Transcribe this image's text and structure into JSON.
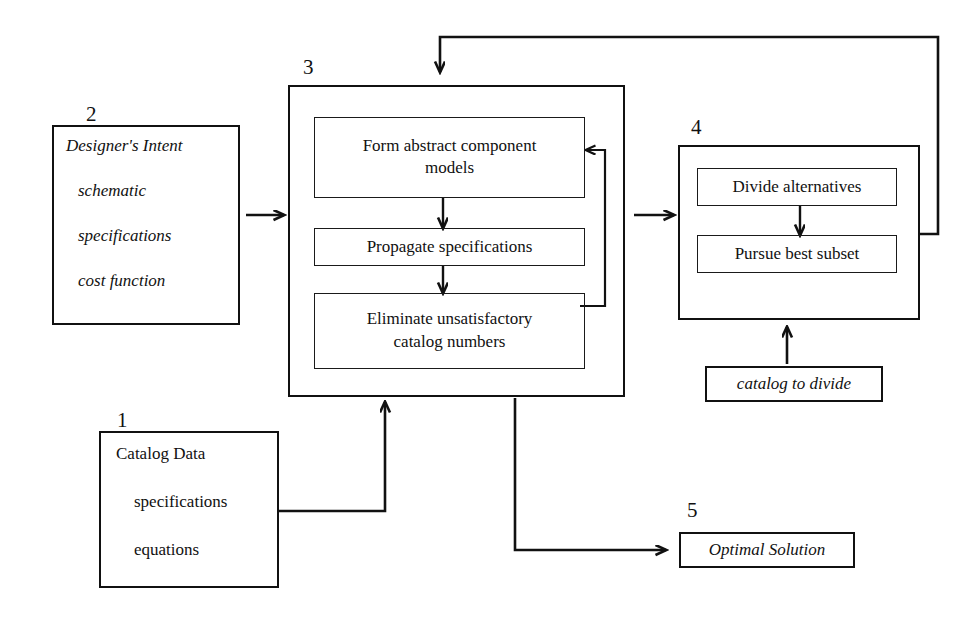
{
  "diagram": {
    "background_color": "#ffffff",
    "line_color": "#111111"
  },
  "numbers": {
    "one": "1",
    "two": "2",
    "three": "3",
    "four": "4",
    "five": "5"
  },
  "block1": {
    "number": "1",
    "lines": [
      "Catalog Data",
      "specifications",
      "equations"
    ]
  },
  "block2": {
    "number": "2",
    "lines": [
      "Designer's Intent",
      "schematic",
      "specifications",
      "cost function"
    ]
  },
  "block3": {
    "number": "3",
    "steps": [
      "Form abstract component\nmodels",
      "Propagate specifications",
      "Eliminate unsatisfactory\ncatalog numbers"
    ],
    "step_labels": {
      "step1_line1": "Form abstract component",
      "step1_line2": "models",
      "step2_line1": "Propagate specifications",
      "step3_line1": "Eliminate unsatisfactory",
      "step3_line2": "catalog numbers"
    }
  },
  "block4": {
    "number": "4",
    "steps": [
      "Divide alternatives",
      "Pursue best subset"
    ]
  },
  "catalog_to_divide": {
    "label": "catalog to divide"
  },
  "block5": {
    "number": "5",
    "label": "Optimal Solution"
  },
  "connectors": [
    {
      "name": "block2-to-block3",
      "kind": "arrow-right"
    },
    {
      "name": "block3-to-block4",
      "kind": "arrow-right"
    },
    {
      "name": "block1-to-block3",
      "kind": "elbow-up-arrow"
    },
    {
      "name": "block3-to-block5",
      "kind": "elbow-right-arrow"
    },
    {
      "name": "block4-feedback-to-block3",
      "kind": "elbow-top-loop-arrow"
    },
    {
      "name": "block3-internal-feedback",
      "kind": "elbow-left-arrow"
    },
    {
      "name": "catalog-to-block4",
      "kind": "arrow-up"
    },
    {
      "name": "block3-step1-to-step2",
      "kind": "arrow-down"
    },
    {
      "name": "block3-step2-to-step3",
      "kind": "arrow-down"
    },
    {
      "name": "block4-step1-to-step2",
      "kind": "arrow-down"
    }
  ]
}
